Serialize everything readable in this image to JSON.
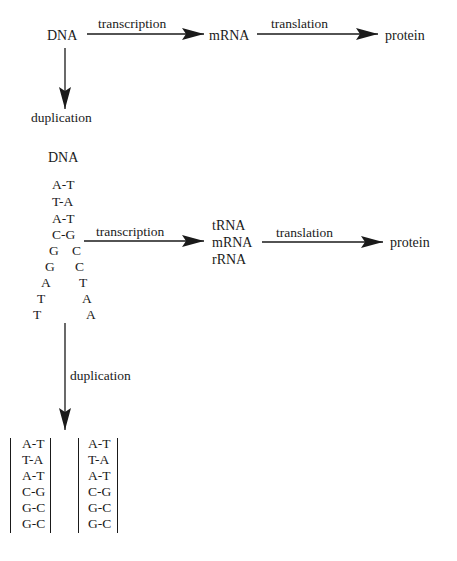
{
  "top_flow": {
    "source": "DNA",
    "transcription_label": "transcription",
    "intermediate": "mRNA",
    "translation_label": "translation",
    "product": "protein",
    "duplication_label": "duplication"
  },
  "detail_flow": {
    "title": "DNA",
    "paired_rows": [
      "A-T",
      "T-A",
      "A-T",
      "C-G"
    ],
    "split_rows": [
      {
        "left": "G",
        "right": "C"
      },
      {
        "left": "G",
        "right": "C"
      },
      {
        "left": "A",
        "right": "T"
      },
      {
        "left": "T",
        "right": "A"
      },
      {
        "left": "T",
        "right": "A"
      }
    ],
    "transcription_label": "transcription",
    "rna_types": [
      "tRNA",
      "mRNA",
      "rRNA"
    ],
    "translation_label": "translation",
    "product": "protein",
    "duplication_label": "duplication"
  },
  "daughter_strands": [
    {
      "rows": [
        "A-T",
        "T-A",
        "A-T",
        "C-G",
        "G-C",
        "G-C"
      ]
    },
    {
      "rows": [
        "A-T",
        "T-A",
        "A-T",
        "C-G",
        "G-C",
        "G-C"
      ]
    }
  ]
}
